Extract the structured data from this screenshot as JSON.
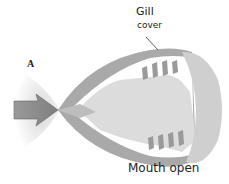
{
  "diagram": {
    "panel_label": "A",
    "labels": {
      "gill_line1": "Gill",
      "gill_line2": "cover",
      "caption": "Mouth open"
    },
    "colors": {
      "body_outer": "#a8a8a8",
      "body_inner": "#dcdcdc",
      "head_cap": "#cfcfcf",
      "gill_filaments": "#9a9a9a",
      "arrow": "#8c8c8c",
      "water_glow": "#e6e6e6"
    },
    "elements": [
      "water-flow-arrow",
      "mouth",
      "gill-cover",
      "gill-filaments",
      "mouth-cavity"
    ]
  }
}
